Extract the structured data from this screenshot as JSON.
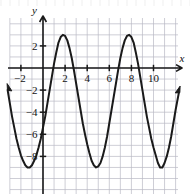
{
  "figure": {
    "axis_label_x": "x",
    "axis_label_y": "y",
    "x_tick_labels": [
      "−2",
      "2",
      "4",
      "6",
      "8",
      "10"
    ],
    "x_tick_values": [
      -2,
      2,
      4,
      6,
      8,
      10
    ],
    "y_tick_labels": [
      "2",
      "−2",
      "−4",
      "−6",
      "−8"
    ],
    "y_tick_values": [
      2,
      -2,
      -4,
      -6,
      -8
    ],
    "curve_color": "#1a1a1a",
    "grid_color": "#b9b9c4",
    "axis_color": "#1a1a1a"
  },
  "chart_data": {
    "type": "line",
    "title": "",
    "xlabel": "x",
    "ylabel": "y",
    "xlim": [
      -3.2,
      12.3
    ],
    "ylim": [
      -10.6,
      4.4
    ],
    "grid": true,
    "grid_step_x": 1,
    "grid_step_y": 1,
    "legend": "none",
    "series": [
      {
        "name": "sinusoid",
        "form": "y = 6*sin((2*pi/6)*(x - 0.1)) - 3",
        "amplitude": 6,
        "period": 6,
        "midline": -3,
        "maxima": [
          {
            "x": 1.6,
            "y": 3
          },
          {
            "x": 7.6,
            "y": 3
          }
        ],
        "minima": [
          {
            "x": -1.4,
            "y": -9
          },
          {
            "x": 4.6,
            "y": -9
          },
          {
            "x": 10.6,
            "y": -9
          }
        ],
        "y_intercept": -6,
        "x_points": [
          -3.2,
          -3.0,
          -2.8,
          -2.6,
          -2.4,
          -2.2,
          -2.0,
          -1.8,
          -1.6,
          -1.4,
          -1.2,
          -1.0,
          -0.8,
          -0.6,
          -0.4,
          -0.2,
          0.0,
          0.2,
          0.4,
          0.6,
          0.8,
          1.0,
          1.2,
          1.4,
          1.6,
          1.8,
          2.0,
          2.2,
          2.4,
          2.6,
          2.8,
          3.0,
          3.2,
          3.4,
          3.6,
          3.8,
          4.0,
          4.2,
          4.4,
          4.6,
          4.8,
          5.0,
          5.2,
          5.4,
          5.6,
          5.8,
          6.0,
          6.2,
          6.4,
          6.6,
          6.8,
          7.0,
          7.2,
          7.4,
          7.6,
          7.8,
          8.0,
          8.2,
          8.4,
          8.6,
          8.8,
          9.0,
          9.2,
          9.4,
          9.6,
          9.8,
          10.0,
          10.2,
          10.4,
          10.6,
          10.8,
          11.0,
          11.2,
          11.4,
          11.6,
          11.8,
          12.0,
          12.3
        ],
        "y_points": [
          -2.0,
          -3.2,
          -4.4,
          -5.4,
          -6.4,
          -7.2,
          -7.9,
          -8.4,
          -8.8,
          -9.0,
          -9.0,
          -8.8,
          -8.4,
          -7.9,
          -7.2,
          -6.4,
          -5.4,
          -4.4,
          -3.2,
          -2.0,
          -0.8,
          0.4,
          1.4,
          2.3,
          2.8,
          3.0,
          2.9,
          2.5,
          1.8,
          0.9,
          -0.2,
          -1.4,
          -2.6,
          -3.8,
          -5.0,
          -6.0,
          -6.9,
          -7.7,
          -8.4,
          -8.8,
          -9.0,
          -8.9,
          -8.6,
          -8.0,
          -7.2,
          -6.2,
          -5.0,
          -3.8,
          -2.6,
          -1.4,
          -0.2,
          0.9,
          1.8,
          2.5,
          2.9,
          3.0,
          2.8,
          2.3,
          1.4,
          0.4,
          -0.8,
          -2.0,
          -3.2,
          -4.4,
          -5.4,
          -6.4,
          -7.2,
          -7.9,
          -8.6,
          -9.0,
          -9.0,
          -8.6,
          -8.0,
          -7.2,
          -6.2,
          -5.0,
          -3.8,
          -2.2
        ]
      }
    ],
    "arrows": [
      {
        "name": "curve-left-arrow",
        "x": -3.2,
        "y": -2.0,
        "direction": "up-left"
      },
      {
        "name": "curve-right-arrow",
        "x": 12.3,
        "y": -2.2,
        "direction": "up-right"
      },
      {
        "name": "x-axis-arrow",
        "x": 12.3,
        "y": 0,
        "direction": "right"
      },
      {
        "name": "y-axis-arrow",
        "x": 0,
        "y": 4.4,
        "direction": "up"
      }
    ]
  }
}
